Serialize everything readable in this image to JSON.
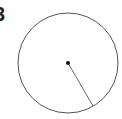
{
  "diagram": {
    "label": "3",
    "circle": {
      "cx": 68,
      "cy": 63,
      "r": 50,
      "stroke": "#555555",
      "stroke_width": 1
    },
    "center_point": {
      "x": 68,
      "y": 63,
      "r": 2,
      "fill": "#111111"
    },
    "radius_line": {
      "x1": 68,
      "y1": 63,
      "x2": 93,
      "y2": 106,
      "stroke": "#666666",
      "stroke_width": 1
    }
  }
}
